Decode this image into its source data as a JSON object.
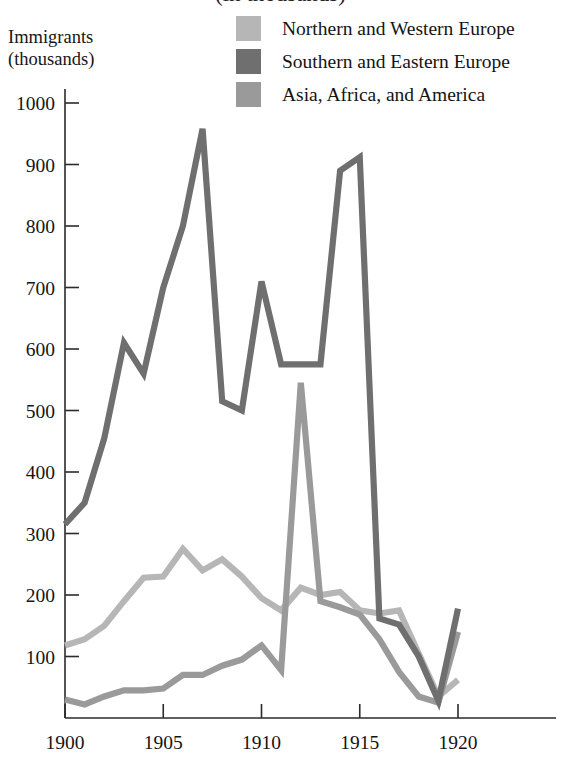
{
  "title": {
    "partial_text": "(in thousands)"
  },
  "axis_caption": {
    "line1": "Immigrants",
    "line2": "(thousands)"
  },
  "legend": {
    "items": [
      {
        "label": "Northern and Western Europe",
        "color": "#b6b6b6",
        "swatch_name": "legend-swatch-northern-western-europe"
      },
      {
        "label": "Southern and Eastern Europe",
        "color": "#6f6f6f",
        "swatch_name": "legend-swatch-southern-eastern-europe"
      },
      {
        "label": "Asia, Africa, and America",
        "color": "#9a9a9a",
        "swatch_name": "legend-swatch-asia-africa-america"
      }
    ]
  },
  "chart_data": {
    "type": "line",
    "xlabel": "",
    "ylabel": "Immigrants (thousands)",
    "xlim": [
      1900,
      1920.5
    ],
    "ylim": [
      0,
      1000
    ],
    "xticks": [
      1900,
      1905,
      1910,
      1915,
      1920
    ],
    "xtick_labels": [
      "1900",
      "1905",
      "1910",
      "1915",
      "1920"
    ],
    "yticks": [
      100,
      200,
      300,
      400,
      500,
      600,
      700,
      800,
      900,
      1000
    ],
    "ytick_labels": [
      "100",
      "200",
      "300",
      "400",
      "500",
      "600",
      "700",
      "800",
      "900",
      "1000"
    ],
    "grid": false,
    "legend_position": "top-right",
    "x": [
      1900,
      1901,
      1902,
      1903,
      1904,
      1905,
      1906,
      1907,
      1908,
      1909,
      1910,
      1911,
      1912,
      1913,
      1914,
      1915,
      1916,
      1917,
      1918,
      1919,
      1920
    ],
    "series": [
      {
        "name": "Northern and Western Europe",
        "color": "#b6b6b6",
        "values": [
          118,
          128,
          150,
          190,
          228,
          230,
          275,
          240,
          258,
          230,
          195,
          175,
          212,
          200,
          205,
          175,
          170,
          175,
          105,
          35,
          62
        ]
      },
      {
        "name": "Southern and Eastern Europe",
        "color": "#6f6f6f",
        "values": [
          315,
          350,
          455,
          610,
          560,
          700,
          800,
          958,
          515,
          500,
          710,
          575,
          575,
          575,
          890,
          912,
          162,
          152,
          100,
          28,
          178
        ]
      },
      {
        "name": "Asia, Africa, and America",
        "color": "#9a9a9a",
        "values": [
          30,
          22,
          35,
          45,
          45,
          48,
          70,
          70,
          85,
          95,
          118,
          78,
          545,
          190,
          180,
          168,
          128,
          75,
          35,
          25,
          140
        ]
      }
    ]
  }
}
